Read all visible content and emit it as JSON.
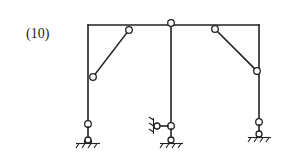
{
  "figure": {
    "label": "(10)",
    "type": "structural frame diagram",
    "colors": {
      "line": "#222222",
      "background": "#ffffff"
    },
    "members": [
      {
        "id": "top-beam",
        "kind": "beam"
      },
      {
        "id": "left-column",
        "kind": "column"
      },
      {
        "id": "center-column",
        "kind": "column"
      },
      {
        "id": "right-column",
        "kind": "column"
      },
      {
        "id": "left-brace",
        "kind": "diagonal link"
      },
      {
        "id": "right-brace",
        "kind": "diagonal link"
      }
    ],
    "supports": [
      {
        "id": "left-support",
        "kind": "pinned support with hinge"
      },
      {
        "id": "center-support",
        "kind": "pinned support with hinge and horizontal link to wall"
      },
      {
        "id": "right-support",
        "kind": "pinned support with hinge"
      }
    ]
  }
}
